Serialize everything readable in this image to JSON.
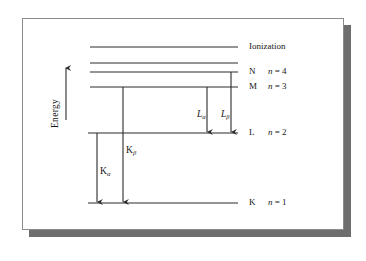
{
  "figure": {
    "axis_label": "Energy",
    "axis_arrow_direction": "up",
    "background_color": "#ffffff",
    "line_color": "#2a2a2a",
    "frame_color": "#8c8c8c",
    "shadow_color": "#6e6e6e"
  },
  "levels": [
    {
      "id": "ionization",
      "shell": "",
      "quantum_prefix": "",
      "quantum_italic": "",
      "quantum_suffix": "",
      "label": "Ionization",
      "y": 47,
      "x_start": 90,
      "x_end": 238
    },
    {
      "id": "unlabeled-upper-1",
      "shell": "",
      "label": "",
      "y": 63,
      "x_start": 90,
      "x_end": 238
    },
    {
      "id": "n4",
      "shell": "N",
      "quantum_prefix": "",
      "quantum_italic": "n",
      "quantum_suffix": " = 4",
      "label": "N",
      "y": 72,
      "x_start": 90,
      "x_end": 238
    },
    {
      "id": "n3",
      "shell": "M",
      "quantum_prefix": "",
      "quantum_italic": "n",
      "quantum_suffix": " = 3",
      "label": "M",
      "y": 87,
      "x_start": 90,
      "x_end": 238
    },
    {
      "id": "n2",
      "shell": "L",
      "quantum_prefix": "",
      "quantum_italic": "n",
      "quantum_suffix": " = 2",
      "label": "L",
      "y": 133,
      "x_start": 88,
      "x_end": 238
    },
    {
      "id": "n1",
      "shell": "K",
      "quantum_prefix": "",
      "quantum_italic": "n",
      "quantum_suffix": " = 1",
      "label": "K",
      "y": 203,
      "x_start": 88,
      "x_end": 238
    }
  ],
  "transitions": [
    {
      "id": "k-alpha",
      "base": "K",
      "base_style": "roman",
      "subscript": "α",
      "from_level": "n2",
      "to_level": "n1",
      "x": 97,
      "y_start": 133,
      "y_end": 203,
      "label_x": 100,
      "label_y": 167
    },
    {
      "id": "k-beta",
      "base": "K",
      "base_style": "roman",
      "subscript": "β",
      "from_level": "n3",
      "to_level": "n1",
      "x": 123,
      "y_start": 87,
      "y_end": 203,
      "label_x": 126,
      "label_y": 146
    },
    {
      "id": "l-alpha",
      "base": "L",
      "base_style": "italic",
      "subscript": "α",
      "from_level": "n3",
      "to_level": "n2",
      "x": 207,
      "y_start": 87,
      "y_end": 133,
      "label_x": 197,
      "label_y": 110
    },
    {
      "id": "l-beta",
      "base": "L",
      "base_style": "italic",
      "subscript": "β",
      "from_level": "n4",
      "to_level": "n2",
      "x": 231,
      "y_start": 72,
      "y_end": 133,
      "label_x": 221,
      "label_y": 110
    }
  ]
}
